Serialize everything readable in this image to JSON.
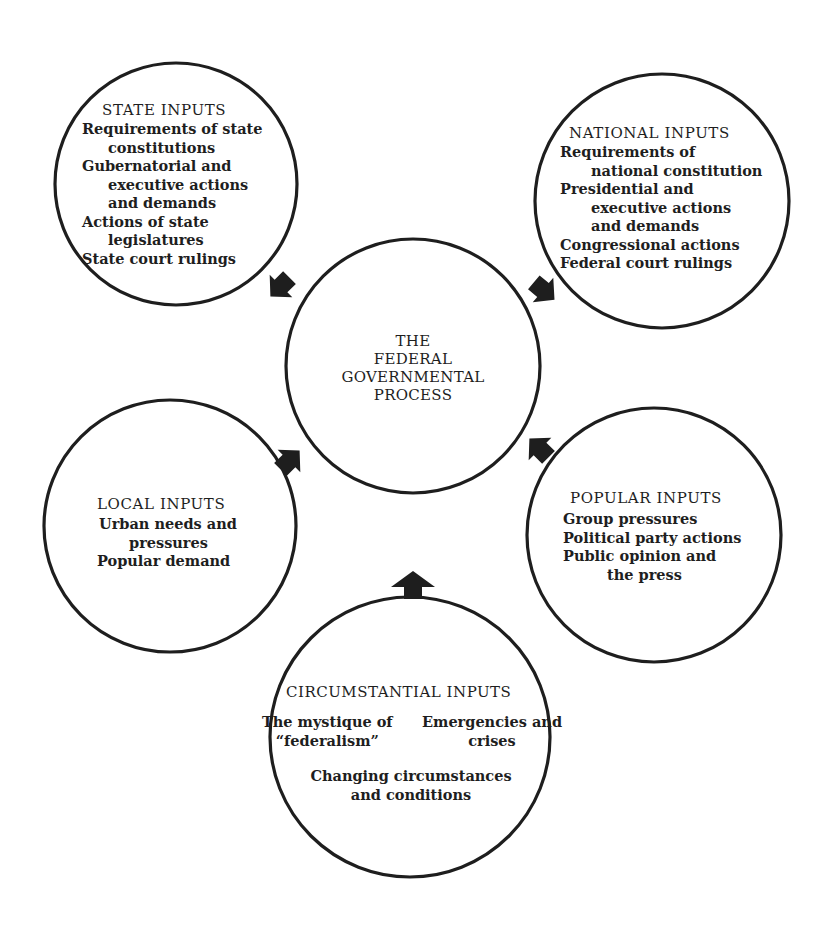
{
  "diagram": {
    "colors": {
      "ink": "#1e1e1e",
      "paper": "#ffffff"
    },
    "center": {
      "lines": [
        "THE",
        "FEDERAL",
        "GOVERNMENTAL",
        "PROCESS"
      ]
    },
    "nodes": {
      "state": {
        "title": "STATE INPUTS",
        "lines": [
          {
            "text": "Requirements of state",
            "indent": false
          },
          {
            "text": "constitutions",
            "indent": true
          },
          {
            "text": "Gubernatorial and",
            "indent": false
          },
          {
            "text": "executive  actions",
            "indent": true
          },
          {
            "text": "and  demands",
            "indent": true
          },
          {
            "text": "Actions of state",
            "indent": false
          },
          {
            "text": "legislatures",
            "indent": true
          },
          {
            "text": "State court rulings",
            "indent": false
          }
        ],
        "arrow_direction": "toward-center"
      },
      "national": {
        "title": "NATIONAL INPUTS",
        "lines": [
          {
            "text": "Requirements of",
            "indent": false
          },
          {
            "text": "national constitution",
            "indent": true
          },
          {
            "text": "Presidential and",
            "indent": false
          },
          {
            "text": "executive  actions",
            "indent": true
          },
          {
            "text": "and demands",
            "indent": true
          },
          {
            "text": "Congressional actions",
            "indent": false
          },
          {
            "text": "Federal court rulings",
            "indent": false
          }
        ],
        "arrow_direction": "toward-center"
      },
      "local": {
        "title": "LOCAL INPUTS",
        "lines": [
          {
            "text": "Urban needs and",
            "indent": false
          },
          {
            "text": "pressures",
            "indent": true
          },
          {
            "text": "Popular demand",
            "indent": false
          }
        ],
        "arrow_direction": "toward-center"
      },
      "popular": {
        "title": "POPULAR INPUTS",
        "lines": [
          {
            "text": "Group pressures",
            "indent": false
          },
          {
            "text": "Political party actions",
            "indent": false
          },
          {
            "text": "Public opinion and",
            "indent": false
          },
          {
            "text": "the press",
            "indent": true
          }
        ],
        "arrow_direction": "toward-center"
      },
      "circumstantial": {
        "title": "CIRCUMSTANTIAL INPUTS",
        "left_lines": [
          "The mystique of",
          "“federalism”"
        ],
        "right_lines": [
          "Emergencies and",
          "crises"
        ],
        "bottom_lines": [
          "Changing circumstances",
          "and conditions"
        ],
        "arrow_direction": "toward-center"
      }
    }
  }
}
